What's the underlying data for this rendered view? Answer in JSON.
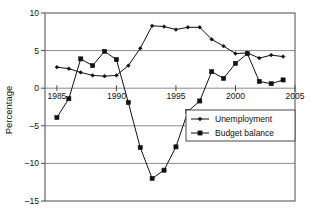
{
  "chart_data": {
    "type": "line",
    "title": "",
    "xlabel": "",
    "ylabel": "Percentage",
    "xlim": [
      1984,
      2005
    ],
    "ylim": [
      -15,
      10
    ],
    "xticks": [
      1985,
      1990,
      1995,
      2000,
      2005
    ],
    "yticks": [
      -15,
      -10,
      -5,
      0,
      5,
      10
    ],
    "xtick_labels": [
      "1985",
      "1990",
      "1995",
      "2000",
      "2005"
    ],
    "ytick_labels": [
      "-15",
      "-10",
      "-5",
      "0",
      "5",
      "10"
    ],
    "grid": "horizontal",
    "legend_position": "center-right",
    "x": [
      1985,
      1986,
      1987,
      1988,
      1989,
      1990,
      1991,
      1992,
      1993,
      1994,
      1995,
      1996,
      1997,
      1998,
      1999,
      2000,
      2001,
      2002,
      2003,
      2004
    ],
    "series": [
      {
        "name": "Unemployment",
        "marker": "diamond",
        "color": "#111111",
        "values": [
          2.8,
          2.6,
          2.1,
          1.7,
          1.6,
          1.7,
          3.0,
          5.3,
          8.3,
          8.2,
          7.8,
          8.1,
          8.1,
          6.5,
          5.6,
          4.6,
          4.7,
          4.0,
          4.4,
          4.2
        ]
      },
      {
        "name": "Budget balance",
        "marker": "square",
        "color": "#111111",
        "values": [
          -3.9,
          -1.4,
          3.9,
          3.0,
          4.9,
          3.8,
          -1.9,
          -7.9,
          -12.0,
          -10.9,
          -7.8,
          -3.1,
          -1.7,
          2.2,
          1.3,
          3.3,
          4.6,
          0.9,
          0.6,
          1.1
        ]
      }
    ]
  },
  "legend": {
    "items": [
      {
        "label": "Unemployment",
        "marker": "diamond"
      },
      {
        "label": "Budget balance",
        "marker": "square"
      }
    ]
  },
  "axes": {
    "y_title": "Percentage"
  }
}
